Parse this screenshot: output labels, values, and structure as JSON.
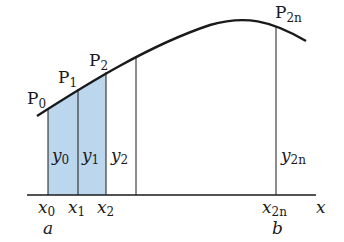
{
  "diagram": {
    "type": "simpson-rule-partition",
    "colors": {
      "shade": "#bcd6ee",
      "line": "#1a1a1a",
      "background": "#ffffff"
    },
    "points": [
      {
        "name": "P",
        "sub": "0"
      },
      {
        "name": "P",
        "sub": "1"
      },
      {
        "name": "P",
        "sub": "2"
      },
      {
        "name": "P",
        "sub": "2n"
      }
    ],
    "ordinates": [
      {
        "name": "y",
        "sub": "0"
      },
      {
        "name": "y",
        "sub": "1"
      },
      {
        "name": "y",
        "sub": "2"
      },
      {
        "name": "y",
        "sub": "2n"
      }
    ],
    "abscissas": [
      {
        "name": "x",
        "sub": "0"
      },
      {
        "name": "x",
        "sub": "1"
      },
      {
        "name": "x",
        "sub": "2"
      },
      {
        "name": "x",
        "sub": "2n"
      }
    ],
    "bounds": {
      "a": "a",
      "b": "b"
    },
    "axis_label": "x"
  }
}
